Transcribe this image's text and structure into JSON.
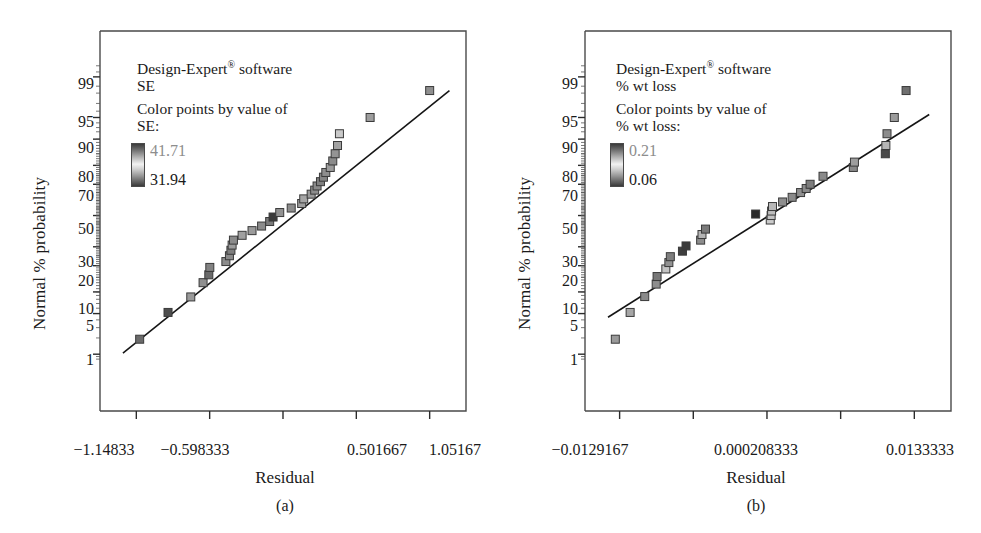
{
  "figure": {
    "panels": [
      {
        "id": "a",
        "caption": "(a)",
        "legend": {
          "software": "Design-Expert",
          "registered_mark": "®",
          "software_suffix": " software",
          "response": "SE",
          "color_note": "Color points by value of",
          "color_response": "SE:",
          "value_high": "41.71",
          "value_low": "31.94"
        },
        "axes": {
          "ylabel": "Normal % probability",
          "xlabel": "Residual",
          "yticks": [
            "99",
            "95",
            "90",
            "80",
            "70",
            "50",
            "30",
            "20",
            "10",
            "5",
            "1"
          ],
          "xticks": [
            "−1.14833",
            "−0.598333",
            "",
            "0.501667",
            "1.05167"
          ]
        }
      },
      {
        "id": "b",
        "caption": "(b)",
        "legend": {
          "software": "Design-Expert",
          "registered_mark": "®",
          "software_suffix": " software",
          "response": "% wt loss",
          "color_note": "Color points by value of",
          "color_response": "% wt loss:",
          "value_high": "0.21",
          "value_low": "0.06"
        },
        "axes": {
          "ylabel": "Normal % probability",
          "xlabel": "Residual",
          "yticks": [
            "99",
            "95",
            "90",
            "80",
            "70",
            "50",
            "30",
            "20",
            "10",
            "5",
            "1"
          ],
          "xticks": [
            "−0.0129167",
            "",
            "0.000208333",
            "",
            "0.0133333"
          ]
        }
      }
    ]
  },
  "chart_data": [
    {
      "type": "scatter",
      "title": "Normal plot of residuals (a)",
      "xlabel": "Residual",
      "ylabel": "Normal % probability",
      "legend_title": "SE",
      "colorbar": {
        "high": 41.71,
        "low": 31.94
      },
      "xlim": [
        -1.4208,
        1.3242
      ],
      "ylim_percent": [
        0.7,
        99.5
      ],
      "ytick_values": [
        99,
        95,
        90,
        80,
        70,
        50,
        30,
        20,
        10,
        5,
        1
      ],
      "xtick_values": [
        -1.14833,
        -0.598333,
        -0.0483333,
        0.501667,
        1.05167
      ],
      "grid": false,
      "reference_line": {
        "x1": -1.2489,
        "y1": 1.05,
        "x2": 1.2,
        "y2": 98.2
      },
      "points": [
        {
          "x": -1.1233,
          "y": 1.9,
          "color": "#6b6b6b"
        },
        {
          "x": -0.9106,
          "y": 5.2,
          "color": "#4e4e4e"
        },
        {
          "x": -0.74,
          "y": 8.6,
          "color": "#9a9a9a"
        },
        {
          "x": -0.6478,
          "y": 13.0,
          "color": "#8f8f8f"
        },
        {
          "x": -0.6047,
          "y": 16.0,
          "color": "#6a6a6a"
        },
        {
          "x": -0.5972,
          "y": 19.2,
          "color": "#828282"
        },
        {
          "x": -0.4767,
          "y": 22.0,
          "color": "#8d8d8d"
        },
        {
          "x": -0.45,
          "y": 25.0,
          "color": "#8a8a8a"
        },
        {
          "x": -0.4389,
          "y": 28.0,
          "color": "#7e7e7e"
        },
        {
          "x": -0.43,
          "y": 31.0,
          "color": "#9c9c9c"
        },
        {
          "x": -0.42,
          "y": 34.0,
          "color": "#8b8b8b"
        },
        {
          "x": -0.355,
          "y": 37.0,
          "color": "#a0a0a0"
        },
        {
          "x": -0.2806,
          "y": 40.0,
          "color": "#9b9b9b"
        },
        {
          "x": -0.2089,
          "y": 43.0,
          "color": "#8b8b8b"
        },
        {
          "x": -0.1483,
          "y": 46.0,
          "color": "#7a7a7a"
        },
        {
          "x": -0.1228,
          "y": 49.0,
          "color": "#3a3a3a"
        },
        {
          "x": -0.0728,
          "y": 52.0,
          "color": "#919191"
        },
        {
          "x": 0.0133,
          "y": 55.0,
          "color": "#8c8c8c"
        },
        {
          "x": 0.0917,
          "y": 58.0,
          "color": "#9f9f9f"
        },
        {
          "x": 0.1072,
          "y": 61.0,
          "color": "#a5a5a5"
        },
        {
          "x": 0.1628,
          "y": 64.0,
          "color": "#9a9a9a"
        },
        {
          "x": 0.1894,
          "y": 66.5,
          "color": "#8d8d8d"
        },
        {
          "x": 0.2072,
          "y": 69.0,
          "color": "#8a8a8a"
        },
        {
          "x": 0.2328,
          "y": 71.5,
          "color": "#808080"
        },
        {
          "x": 0.255,
          "y": 74.0,
          "color": "#868686"
        },
        {
          "x": 0.2728,
          "y": 76.5,
          "color": "#8e8e8e"
        },
        {
          "x": 0.3061,
          "y": 79.0,
          "color": "#9c9c9c"
        },
        {
          "x": 0.325,
          "y": 82.0,
          "color": "#8b8b8b"
        },
        {
          "x": 0.3428,
          "y": 85.0,
          "color": "#949494"
        },
        {
          "x": 0.3606,
          "y": 88.0,
          "color": "#a2a2a2"
        },
        {
          "x": 0.375,
          "y": 91.5,
          "color": "#c9c9c9"
        },
        {
          "x": 0.605,
          "y": 95.0,
          "color": "#9d9d9d"
        },
        {
          "x": 1.0517,
          "y": 98.2,
          "color": "#8f8f8f"
        }
      ]
    },
    {
      "type": "scatter",
      "title": "Normal plot of residuals (b)",
      "xlabel": "Residual",
      "ylabel": "Normal % probability",
      "legend_title": "% wt loss",
      "colorbar": {
        "high": 0.21,
        "low": 0.06
      },
      "xlim": [
        -0.016,
        0.0166
      ],
      "ylim_percent": [
        0.7,
        99.5
      ],
      "ytick_values": [
        99,
        95,
        90,
        80,
        70,
        50,
        30,
        20,
        10,
        5,
        1
      ],
      "xtick_values": [
        -0.0129167,
        -0.00635417,
        0.000208333,
        0.00677083,
        0.0133333
      ],
      "grid": false,
      "reference_line": {
        "x1": -0.01395,
        "y1": 4.4,
        "x2": 0.01466,
        "y2": 95.5
      },
      "points": [
        {
          "x": -0.0133,
          "y": 1.9,
          "color": "#9a9a9a"
        },
        {
          "x": -0.01198,
          "y": 5.2,
          "color": "#a6a6a6"
        },
        {
          "x": -0.01068,
          "y": 8.7,
          "color": "#8a8a8a"
        },
        {
          "x": -0.00966,
          "y": 12.5,
          "color": "#8e8e8e"
        },
        {
          "x": -0.00958,
          "y": 15.3,
          "color": "#787878"
        },
        {
          "x": -0.0088,
          "y": 18.5,
          "color": "#c4c4c4"
        },
        {
          "x": -0.00853,
          "y": 21.5,
          "color": "#919191"
        },
        {
          "x": -0.0084,
          "y": 24.5,
          "color": "#7e7e7e"
        },
        {
          "x": -0.00732,
          "y": 27.5,
          "color": "#3e3e3e"
        },
        {
          "x": -0.007,
          "y": 30.5,
          "color": "#3a3a3a"
        },
        {
          "x": -0.0057,
          "y": 34.0,
          "color": "#8d8d8d"
        },
        {
          "x": -0.00558,
          "y": 37.5,
          "color": "#b4b4b4"
        },
        {
          "x": -0.00527,
          "y": 41.0,
          "color": "#7a7a7a"
        },
        {
          "x": -0.0008,
          "y": 51.0,
          "color": "#2b2b2b"
        },
        {
          "x": 0.0005,
          "y": 47.0,
          "color": "#cbcbcb"
        },
        {
          "x": 0.00058,
          "y": 50.0,
          "color": "#c2c2c2"
        },
        {
          "x": 0.00062,
          "y": 53.0,
          "color": "#bdbdbd"
        },
        {
          "x": 0.0007,
          "y": 56.0,
          "color": "#b8b8b8"
        },
        {
          "x": 0.0016,
          "y": 59.0,
          "color": "#8e8e8e"
        },
        {
          "x": 0.00245,
          "y": 62.0,
          "color": "#8a8a8a"
        },
        {
          "x": 0.0032,
          "y": 65.0,
          "color": "#8f8f8f"
        },
        {
          "x": 0.0037,
          "y": 67.5,
          "color": "#8b8b8b"
        },
        {
          "x": 0.00405,
          "y": 70.0,
          "color": "#7d7d7d"
        },
        {
          "x": 0.0052,
          "y": 74.5,
          "color": "#8a8a8a"
        },
        {
          "x": 0.0079,
          "y": 79.0,
          "color": "#898989"
        },
        {
          "x": 0.008,
          "y": 81.5,
          "color": "#9d9d9d"
        },
        {
          "x": 0.01075,
          "y": 85.0,
          "color": "#4a4a4a"
        },
        {
          "x": 0.0108,
          "y": 88.0,
          "color": "#b6b6b6"
        },
        {
          "x": 0.0109,
          "y": 91.5,
          "color": "#8c8c8c"
        },
        {
          "x": 0.01155,
          "y": 95.0,
          "color": "#9b9b9b"
        },
        {
          "x": 0.0126,
          "y": 98.2,
          "color": "#6f6f6f"
        }
      ]
    }
  ]
}
